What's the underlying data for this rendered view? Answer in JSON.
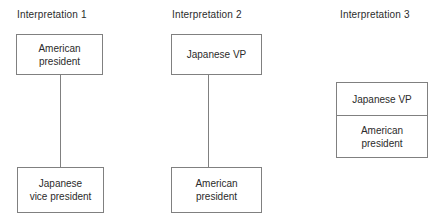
{
  "diagram": {
    "title_visible": false,
    "background_color": "#ffffff",
    "box_border_color": "#808080",
    "text_color": "#2b2b2b",
    "columns": [
      {
        "heading": "Interpretation 1",
        "nodes": [
          {
            "label": "American\npresident"
          },
          {
            "label": "Japanese\nvice president"
          }
        ],
        "connector": "vertical-line"
      },
      {
        "heading": "Interpretation 2",
        "nodes": [
          {
            "label": "Japanese VP"
          },
          {
            "label": "American\npresident"
          }
        ],
        "connector": "vertical-line"
      },
      {
        "heading": "Interpretation 3",
        "nodes": [
          {
            "label": "Japanese VP"
          },
          {
            "label": "American\npresident"
          }
        ],
        "connector": "none"
      }
    ]
  }
}
